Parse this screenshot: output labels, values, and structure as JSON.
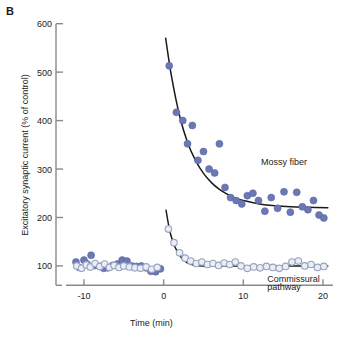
{
  "figure": {
    "panel_letter": "B",
    "width": 342,
    "height": 340
  },
  "chart_data": {
    "type": "scatter",
    "title": "",
    "xlabel": "Time (min)",
    "ylabel": "Excitatory synaptic current (% of control)",
    "xlim": [
      -12,
      21
    ],
    "ylim": [
      40,
      620
    ],
    "xticks": [
      -10,
      0,
      10,
      20
    ],
    "xtick_labels": [
      "-10",
      "0",
      "10",
      "20"
    ],
    "yticks": [
      100,
      200,
      300,
      400,
      500,
      600
    ],
    "ytick_labels": [
      "100",
      "200",
      "300",
      "400",
      "500",
      "600"
    ],
    "grid": false,
    "legend_position": "inline-annotation",
    "annotations": [
      {
        "text": "Mossy fiber",
        "x": 12.2,
        "y": 312
      },
      {
        "text": "Commissural",
        "x": 13.0,
        "y": 72
      },
      {
        "text": "pathway",
        "x": 13.0,
        "y": 55
      }
    ],
    "series": [
      {
        "name": "Mossy fiber",
        "marker": "filled-circle",
        "color": "#6b78b4",
        "edge_color": "#5a67a6",
        "points": [
          {
            "x": -11.0,
            "y": 108
          },
          {
            "x": -10.6,
            "y": 97
          },
          {
            "x": -10.0,
            "y": 112
          },
          {
            "x": -9.6,
            "y": 104
          },
          {
            "x": -9.1,
            "y": 122
          },
          {
            "x": -8.6,
            "y": 101
          },
          {
            "x": -8.0,
            "y": 99
          },
          {
            "x": -7.5,
            "y": 95
          },
          {
            "x": -7.0,
            "y": 96
          },
          {
            "x": -6.4,
            "y": 101
          },
          {
            "x": -5.8,
            "y": 104
          },
          {
            "x": -5.2,
            "y": 112
          },
          {
            "x": -4.6,
            "y": 110
          },
          {
            "x": -4.0,
            "y": 100
          },
          {
            "x": -3.4,
            "y": 99
          },
          {
            "x": -2.8,
            "y": 100
          },
          {
            "x": -2.2,
            "y": 96
          },
          {
            "x": -1.6,
            "y": 89
          },
          {
            "x": -1.0,
            "y": 88
          },
          {
            "x": -0.4,
            "y": 94
          },
          {
            "x": 0.7,
            "y": 513
          },
          {
            "x": 1.6,
            "y": 417
          },
          {
            "x": 2.4,
            "y": 400
          },
          {
            "x": 3.0,
            "y": 352
          },
          {
            "x": 3.6,
            "y": 390
          },
          {
            "x": 4.3,
            "y": 318
          },
          {
            "x": 5.0,
            "y": 336
          },
          {
            "x": 5.7,
            "y": 300
          },
          {
            "x": 6.4,
            "y": 292
          },
          {
            "x": 7.0,
            "y": 352
          },
          {
            "x": 7.7,
            "y": 262
          },
          {
            "x": 8.4,
            "y": 241
          },
          {
            "x": 9.1,
            "y": 235
          },
          {
            "x": 9.8,
            "y": 228
          },
          {
            "x": 10.5,
            "y": 245
          },
          {
            "x": 11.2,
            "y": 250
          },
          {
            "x": 11.9,
            "y": 235
          },
          {
            "x": 12.7,
            "y": 213
          },
          {
            "x": 13.5,
            "y": 241
          },
          {
            "x": 14.3,
            "y": 219
          },
          {
            "x": 15.1,
            "y": 253
          },
          {
            "x": 15.9,
            "y": 211
          },
          {
            "x": 16.7,
            "y": 252
          },
          {
            "x": 17.4,
            "y": 222
          },
          {
            "x": 18.1,
            "y": 216
          },
          {
            "x": 18.8,
            "y": 235
          },
          {
            "x": 19.5,
            "y": 205
          },
          {
            "x": 20.1,
            "y": 199
          }
        ]
      },
      {
        "name": "Commissural pathway",
        "marker": "open-circle",
        "color": "#d5dced",
        "edge_color": "#9aa3bd",
        "points": [
          {
            "x": -10.9,
            "y": 100
          },
          {
            "x": -10.3,
            "y": 95
          },
          {
            "x": -9.7,
            "y": 102
          },
          {
            "x": -9.2,
            "y": 98
          },
          {
            "x": -8.6,
            "y": 105
          },
          {
            "x": -8.0,
            "y": 99
          },
          {
            "x": -7.4,
            "y": 104
          },
          {
            "x": -6.8,
            "y": 97
          },
          {
            "x": -6.2,
            "y": 101
          },
          {
            "x": -5.6,
            "y": 97
          },
          {
            "x": -5.0,
            "y": 100
          },
          {
            "x": -4.3,
            "y": 98
          },
          {
            "x": -3.6,
            "y": 96
          },
          {
            "x": -2.9,
            "y": 95
          },
          {
            "x": -2.2,
            "y": 98
          },
          {
            "x": -1.5,
            "y": 93
          },
          {
            "x": -0.8,
            "y": 97
          },
          {
            "x": 0.6,
            "y": 176
          },
          {
            "x": 1.3,
            "y": 148
          },
          {
            "x": 2.0,
            "y": 127
          },
          {
            "x": 2.7,
            "y": 116
          },
          {
            "x": 3.4,
            "y": 110
          },
          {
            "x": 4.1,
            "y": 105
          },
          {
            "x": 4.8,
            "y": 108
          },
          {
            "x": 5.5,
            "y": 103
          },
          {
            "x": 6.2,
            "y": 105
          },
          {
            "x": 6.9,
            "y": 101
          },
          {
            "x": 7.6,
            "y": 106
          },
          {
            "x": 8.3,
            "y": 103
          },
          {
            "x": 9.0,
            "y": 108
          },
          {
            "x": 9.7,
            "y": 100
          },
          {
            "x": 10.5,
            "y": 95
          },
          {
            "x": 11.3,
            "y": 98
          },
          {
            "x": 12.1,
            "y": 96
          },
          {
            "x": 12.9,
            "y": 99
          },
          {
            "x": 13.7,
            "y": 97
          },
          {
            "x": 14.5,
            "y": 95
          },
          {
            "x": 15.3,
            "y": 99
          },
          {
            "x": 16.1,
            "y": 108
          },
          {
            "x": 16.9,
            "y": 110
          },
          {
            "x": 17.7,
            "y": 100
          },
          {
            "x": 18.5,
            "y": 103
          },
          {
            "x": 19.3,
            "y": 97
          },
          {
            "x": 20.1,
            "y": 99
          }
        ]
      }
    ],
    "fit_curves": [
      {
        "name": "Mossy fiber decay fit",
        "color": "#1a1a1a",
        "points": [
          {
            "x": 0.25,
            "y": 570
          },
          {
            "x": 1.0,
            "y": 490
          },
          {
            "x": 2.0,
            "y": 410
          },
          {
            "x": 3.0,
            "y": 355
          },
          {
            "x": 4.0,
            "y": 318
          },
          {
            "x": 5.0,
            "y": 291
          },
          {
            "x": 6.0,
            "y": 272
          },
          {
            "x": 7.0,
            "y": 258
          },
          {
            "x": 8.0,
            "y": 248
          },
          {
            "x": 9.0,
            "y": 240
          },
          {
            "x": 10.0,
            "y": 235
          },
          {
            "x": 12.0,
            "y": 228
          },
          {
            "x": 14.0,
            "y": 224
          },
          {
            "x": 16.0,
            "y": 222
          },
          {
            "x": 18.0,
            "y": 221
          },
          {
            "x": 20.6,
            "y": 220
          }
        ]
      },
      {
        "name": "Commissural pathway decay fit",
        "color": "#1a1a1a",
        "points": [
          {
            "x": 0.3,
            "y": 215
          },
          {
            "x": 0.8,
            "y": 170
          },
          {
            "x": 1.4,
            "y": 140
          },
          {
            "x": 2.0,
            "y": 122
          },
          {
            "x": 2.6,
            "y": 111
          },
          {
            "x": 3.2,
            "y": 105
          },
          {
            "x": 4.0,
            "y": 101
          },
          {
            "x": 5.0,
            "y": 100
          },
          {
            "x": 7.0,
            "y": 100
          },
          {
            "x": 10.0,
            "y": 100
          },
          {
            "x": 14.0,
            "y": 100
          },
          {
            "x": 17.0,
            "y": 100
          },
          {
            "x": 20.6,
            "y": 100
          }
        ]
      }
    ]
  }
}
